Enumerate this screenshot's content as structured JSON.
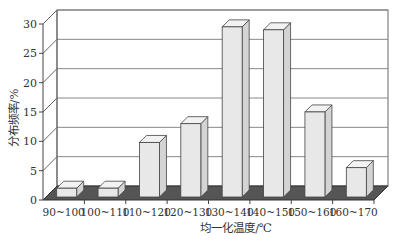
{
  "chart_data": {
    "type": "bar",
    "style": "3d-column",
    "title": "",
    "xlabel": "均一化温度/℃",
    "ylabel": "分布频率/%",
    "categories": [
      "90~100",
      "100~110",
      "110~120",
      "120~130",
      "130~140",
      "140~150",
      "150~160",
      "160~170"
    ],
    "values": [
      1.5,
      1.5,
      9.3,
      12.5,
      29,
      28.5,
      14.5,
      5
    ],
    "yticks": [
      0,
      5,
      10,
      15,
      20,
      25,
      30
    ],
    "ylim": [
      0,
      30
    ],
    "grid": true,
    "legend": null,
    "colors": {
      "bar_face": "#e8e8e8",
      "bar_side": "#d4d4d4",
      "bar_top": "#f2f2f2",
      "floor": "#555555",
      "grid": "#888888"
    }
  }
}
